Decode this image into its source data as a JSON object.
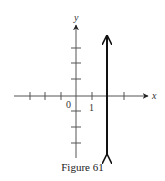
{
  "figure": {
    "caption": "Figure 61",
    "x_axis_label": "x",
    "y_axis_label": "y",
    "origin_label": "0",
    "unit_label": "1",
    "line_description": "vertical line x = 2",
    "line_x_value": 2,
    "colors": {
      "axis": "#555555",
      "line": "#1a1a1a",
      "text": "#333333"
    }
  }
}
